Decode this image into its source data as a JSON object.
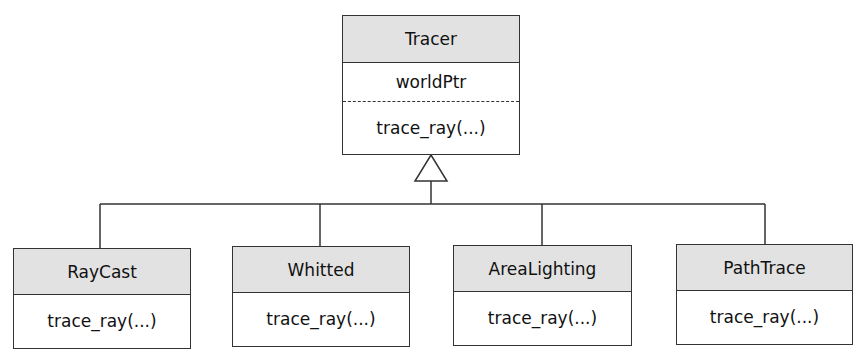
{
  "diagram": {
    "type": "uml-class-inheritance",
    "parent": {
      "name": "Tracer",
      "attributes": [
        "worldPtr"
      ],
      "methods": [
        "trace_ray(...)"
      ]
    },
    "children": [
      {
        "name": "RayCast",
        "methods": [
          "trace_ray(...)"
        ]
      },
      {
        "name": "Whitted",
        "methods": [
          "trace_ray(...)"
        ]
      },
      {
        "name": "AreaLighting",
        "methods": [
          "trace_ray(...)"
        ]
      },
      {
        "name": "PathTrace",
        "methods": [
          "trace_ray(...)"
        ]
      }
    ],
    "colors": {
      "header_fill": "#e2e2e2",
      "line": "#333333",
      "background": "#ffffff"
    }
  }
}
